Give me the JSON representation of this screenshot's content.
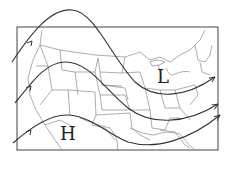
{
  "diagram": {
    "pressure_labels": {
      "low": "L",
      "high": "H"
    },
    "jet_streams": [
      {
        "name": "northern-jet-stream",
        "direction": "west-to-east"
      },
      {
        "name": "middle-jet-stream",
        "direction": "west-to-east"
      },
      {
        "name": "southern-jet-stream",
        "direction": "west-to-east"
      }
    ],
    "colors": {
      "line": "#333333",
      "background": "#ffffff"
    }
  }
}
